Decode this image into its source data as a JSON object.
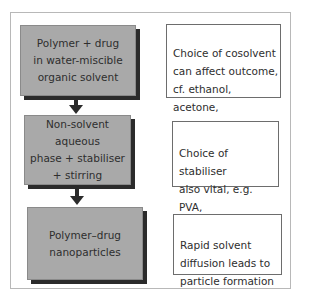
{
  "diagram": {
    "steps": [
      {
        "text": "Polymer + drug\nin water-miscible\norganic solvent"
      },
      {
        "text": "Non-solvent aqueous\nphase + stabiliser\n+ stirring"
      },
      {
        "text": "Polymer–drug\nnanoparticles"
      }
    ],
    "notes": [
      {
        "text": "Choice of cosolvent\ncan affect outcome,\ncf. ethanol, acetone,\nmethanol"
      },
      {
        "text": "Choice of stabiliser\nalso vital, e.g. PVA,\npolysorbate 80"
      },
      {
        "text": "Rapid solvent\ndiffusion leads to\nparticle formation"
      }
    ],
    "colors": {
      "step_fill": "#a9a9a9",
      "shadow": "#2b2b2b",
      "frame": "#b8b8b8"
    }
  }
}
